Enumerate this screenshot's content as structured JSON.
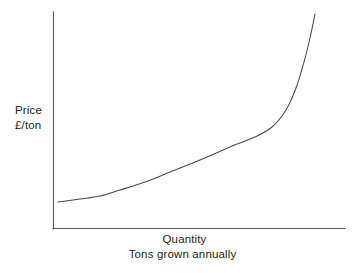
{
  "figure": {
    "background_color": "#ffffff",
    "axis_color": "#58595b",
    "curve_color": "#4b4b4d",
    "text_color": "#231f20"
  },
  "labels": {
    "y_axis_line1": "Price",
    "y_axis_line2": "£/ton",
    "x_axis_line1": "Quantity",
    "x_axis_line2": "Tons grown annually"
  },
  "chart_data": {
    "type": "line",
    "title": "",
    "xlabel": "Quantity — Tons grown annually",
    "ylabel": "Price £/ton",
    "grid": false,
    "legend": null,
    "axes": {
      "x_axis_drawn": true,
      "y_axis_drawn": true,
      "x_ticks": [],
      "y_ticks": [],
      "xlim": [
        0,
        1
      ],
      "ylim": [
        0,
        1
      ]
    },
    "series": [
      {
        "name": "Supply curve",
        "description": "Upward sloping convex supply curve: price rises increasingly steeply as quantity grown annually increases",
        "x": [
          0.02,
          0.1,
          0.2,
          0.3,
          0.4,
          0.5,
          0.6,
          0.7,
          0.78,
          0.84,
          0.88,
          0.9
        ],
        "y": [
          0.12,
          0.14,
          0.17,
          0.22,
          0.28,
          0.34,
          0.42,
          0.5,
          0.6,
          0.72,
          0.86,
          0.99
        ]
      }
    ],
    "path_points_px": [
      [
        58,
        202
      ],
      [
        80,
        199
      ],
      [
        100,
        196
      ],
      [
        120,
        190
      ],
      [
        145,
        182
      ],
      [
        170,
        172
      ],
      [
        200,
        160
      ],
      [
        230,
        147
      ],
      [
        255,
        137
      ],
      [
        272,
        127
      ],
      [
        286,
        110
      ],
      [
        296,
        88
      ],
      [
        304,
        62
      ],
      [
        310,
        38
      ],
      [
        315,
        14
      ]
    ]
  }
}
